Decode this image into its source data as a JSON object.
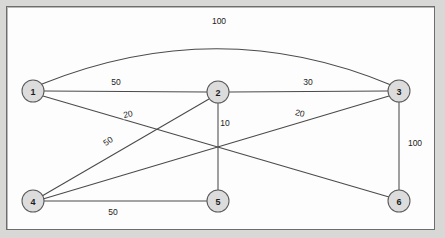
{
  "figure": {
    "kind": "weighted-undirected-graph-diagram",
    "background_color": "#d8d8d6",
    "panel_color": "#fdfdfd",
    "border_color": "#6d6d6d",
    "edge_color": "#4a4a4a",
    "node_fill": "#dcdcdc",
    "node_stroke": "#5a5a5a",
    "text_color": "#1c1c1c"
  },
  "graph_data": {
    "type": "diagram",
    "directed": false,
    "nodes": [
      {
        "id": "1",
        "label": "1",
        "x": 33,
        "y": 91,
        "r": 11
      },
      {
        "id": "2",
        "label": "2",
        "x": 218,
        "y": 92,
        "r": 11
      },
      {
        "id": "3",
        "label": "3",
        "x": 399,
        "y": 91,
        "r": 11
      },
      {
        "id": "4",
        "label": "4",
        "x": 33,
        "y": 201,
        "r": 11
      },
      {
        "id": "5",
        "label": "5",
        "x": 218,
        "y": 201,
        "r": 11
      },
      {
        "id": "6",
        "label": "6",
        "x": 399,
        "y": 201,
        "r": 11
      }
    ],
    "edges": [
      {
        "source": "1",
        "target": "3",
        "weight": "100",
        "shape": "arc",
        "path": "M 42 84 Q 219 13 391 85",
        "label_x": 219,
        "label_y": 21,
        "label_rotate": 0
      },
      {
        "source": "1",
        "target": "2",
        "weight": "50",
        "shape": "line",
        "path": "M 44 91 L 207 92",
        "label_x": 116,
        "label_y": 82,
        "label_rotate": 0
      },
      {
        "source": "1",
        "target": "6",
        "weight": "20",
        "shape": "line",
        "path": "M 43 96 L 389 197",
        "label_x": 128,
        "label_y": 114,
        "label_rotate": -12
      },
      {
        "source": "2",
        "target": "3",
        "weight": "30",
        "shape": "line",
        "path": "M 229 92 L 388 91",
        "label_x": 308,
        "label_y": 82,
        "label_rotate": 0
      },
      {
        "source": "2",
        "target": "5",
        "weight": "10",
        "shape": "line",
        "path": "M 218 103 L 218 190",
        "label_x": 225,
        "label_y": 123,
        "label_rotate": 0
      },
      {
        "source": "2",
        "target": "4",
        "weight": "50",
        "shape": "line",
        "path": "M 209 99 L 42 196",
        "label_x": 108,
        "label_y": 141,
        "label_rotate": -35
      },
      {
        "source": "3",
        "target": "4",
        "weight": "20",
        "shape": "line",
        "path": "M 389 96 L 43 199",
        "label_x": 300,
        "label_y": 113,
        "label_rotate": 12
      },
      {
        "source": "3",
        "target": "6",
        "weight": "100",
        "shape": "line",
        "path": "M 399 102 L 399 190",
        "label_x": 415,
        "label_y": 143,
        "label_rotate": 0
      },
      {
        "source": "4",
        "target": "5",
        "weight": "50",
        "shape": "line",
        "path": "M 44 201 L 207 201",
        "label_x": 113,
        "label_y": 212,
        "label_rotate": 0
      }
    ]
  }
}
